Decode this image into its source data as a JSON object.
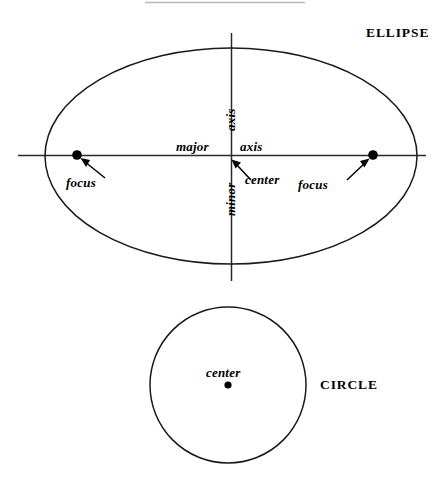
{
  "figure": {
    "title_rule_visible": true,
    "background_color": "#ffffff",
    "stroke_color": "#1a1a1a",
    "rule_color": "#b8b8b8",
    "shapes": [
      {
        "name": "ellipse",
        "display_label": "ELLIPSE",
        "center": [
          231,
          156
        ],
        "rx": 186,
        "ry": 108
      },
      {
        "name": "circle",
        "display_label": "CIRCLE",
        "center": [
          228,
          385
        ],
        "r": 78
      }
    ]
  },
  "ellipse": {
    "shape_label": "ELLIPSE",
    "major_axis_word_1": "major",
    "major_axis_word_2": "axis",
    "minor_axis_word_1": "minor",
    "minor_axis_word_2": "axis",
    "center_label": "center",
    "focus_label_left": "focus",
    "focus_label_right": "focus",
    "focus_left_point": [
      77,
      155
    ],
    "focus_right_point": [
      373,
      155
    ],
    "center_point": [
      231,
      155
    ]
  },
  "circle": {
    "shape_label": "CIRCLE",
    "center_label": "center",
    "center_point": [
      228,
      385
    ]
  }
}
